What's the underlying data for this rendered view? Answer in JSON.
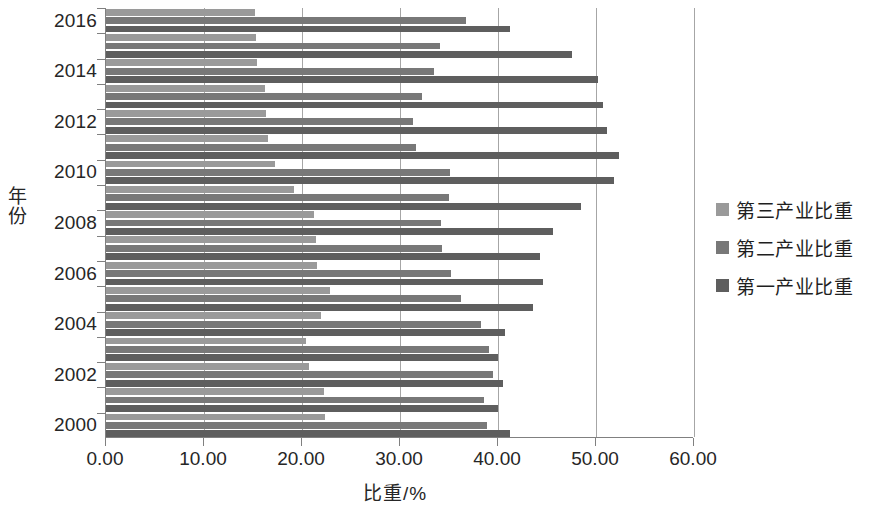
{
  "chart_data": {
    "type": "bar",
    "orientation": "horizontal",
    "title": "",
    "xlabel": "比重/%",
    "ylabel": "年份",
    "xlim": [
      0,
      60
    ],
    "xticks": [
      "0.00",
      "10.00",
      "20.00",
      "30.00",
      "40.00",
      "50.00",
      "60.00"
    ],
    "xtick_values": [
      0,
      10,
      20,
      30,
      40,
      50,
      60
    ],
    "grid": "vertical",
    "legend_position": "right",
    "categories": [
      "2000",
      "2001",
      "2002",
      "2003",
      "2004",
      "2005",
      "2006",
      "2007",
      "2008",
      "2009",
      "2010",
      "2011",
      "2012",
      "2013",
      "2014",
      "2015",
      "2016"
    ],
    "ytick_labels": [
      "2000",
      "2002",
      "2004",
      "2006",
      "2008",
      "2010",
      "2012",
      "2014",
      "2016"
    ],
    "series": [
      {
        "name": "第三产业比重",
        "color": "#9a9a9a",
        "values": [
          22.3,
          22.2,
          20.7,
          20.4,
          21.9,
          22.9,
          21.5,
          21.4,
          21.2,
          19.2,
          17.2,
          16.5,
          16.3,
          16.2,
          15.4,
          15.3,
          15.2
        ]
      },
      {
        "name": "第二产业比重",
        "color": "#787878",
        "values": [
          38.9,
          38.6,
          39.5,
          39.1,
          38.3,
          36.2,
          35.2,
          34.3,
          34.2,
          35.0,
          35.1,
          31.6,
          31.3,
          32.2,
          33.5,
          34.1,
          36.7
        ]
      },
      {
        "name": "第一产业比重",
        "color": "#5e5e5e",
        "values": [
          41.2,
          40.0,
          40.5,
          40.0,
          40.7,
          43.6,
          44.6,
          44.3,
          45.6,
          48.5,
          51.8,
          52.3,
          51.1,
          50.7,
          50.2,
          47.5,
          41.2
        ]
      }
    ]
  },
  "legend": {
    "items": [
      {
        "label": "第三产业比重",
        "color": "#9a9a9a",
        "series_key": "s3"
      },
      {
        "label": "第二产业比重",
        "color": "#787878",
        "series_key": "s2"
      },
      {
        "label": "第一产业比重",
        "color": "#5e5e5e",
        "series_key": "s1"
      }
    ]
  },
  "axes": {
    "x_title": "比重/%",
    "y_title": "年份"
  }
}
